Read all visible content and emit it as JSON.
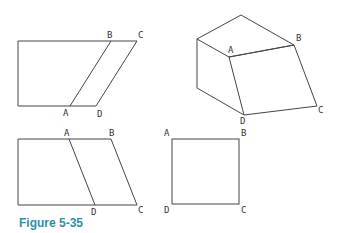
{
  "caption": "Figure 5-35",
  "colors": {
    "line": "#444444",
    "caption": "#2e8fa8"
  },
  "figures": {
    "top_left": {
      "labels": {
        "A": "A",
        "B": "B",
        "C": "C",
        "D": "D"
      }
    },
    "top_right": {
      "labels": {
        "A": "A",
        "B": "B",
        "C": "C",
        "D": "D"
      }
    },
    "bottom_left": {
      "labels": {
        "A": "A",
        "B": "B",
        "C": "C",
        "D": "D"
      }
    },
    "bottom_right": {
      "labels": {
        "A": "A",
        "B": "B",
        "C": "C",
        "D": "D"
      }
    }
  }
}
